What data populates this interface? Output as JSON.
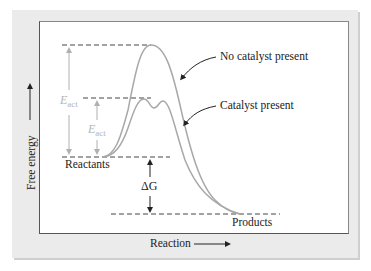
{
  "figure": {
    "title": "",
    "x_axis_label": "Reaction",
    "y_axis_label": "Free energy",
    "curves": [
      {
        "name": "No catalyst present",
        "label": "No catalyst present",
        "color": "#a8a8a8"
      },
      {
        "name": "Catalyst present",
        "label": "Catalyst present",
        "color": "#a8a8a8"
      }
    ],
    "levels": {
      "reactants": "Reactants",
      "products": "Products"
    },
    "annotations": {
      "eact_uncatalyzed": {
        "symbol": "E",
        "subscript": "act"
      },
      "eact_catalyzed": {
        "symbol": "E",
        "subscript": "act"
      },
      "delta_g": "ΔG"
    },
    "colors": {
      "panel_background": "#ebebeb",
      "plot_background": "#ffffff",
      "curve": "#a8a8a8",
      "eact_annotation": "#b5b5b5",
      "text": "#222222",
      "dashed": "#444444"
    }
  }
}
